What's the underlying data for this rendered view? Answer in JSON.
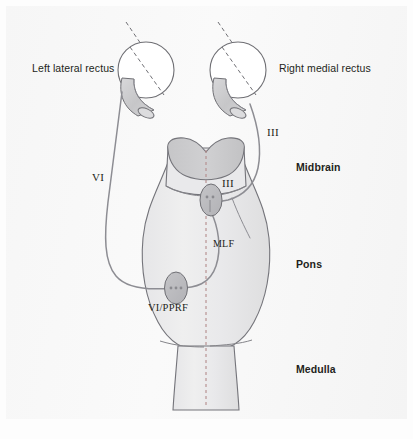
{
  "figure": {
    "name": "brainstem-horizontal-gaze-pathway",
    "background_color": "#f7f7f7",
    "page_color": "#fdfdfd"
  },
  "palette": {
    "outline": "#6f6f74",
    "brainstem_fill_light": "#ececed",
    "brainstem_fill_mid": "#e3e3e5",
    "peduncle_fill": "#c9c9cb",
    "nucleus_fill": "#bdbdc0",
    "muscle_fill": "#cfcfd1",
    "nerve_stroke": "#8d8d93",
    "midline_dash": "#b08a8a",
    "eye_fill": "#ffffff",
    "text": "#231f20"
  },
  "labels": {
    "left_muscle": "Left lateral rectus",
    "right_muscle": "Right medial rectus",
    "nerve_six": "VI",
    "nerve_three_fascicle": "III",
    "nucleus_three": "III",
    "tract_mlf": "MLF",
    "nucleus_six_pprf": "VI/PPRF",
    "region_midbrain": "Midbrain",
    "region_pons": "Pons",
    "region_medulla": "Medulla"
  },
  "structures": {
    "left_eye": "left-eye-globe",
    "right_eye": "right-eye-globe",
    "left_lateral_rectus": "left-lateral-rectus-muscle",
    "right_medial_rectus": "right-medial-rectus-muscle",
    "brainstem": "brainstem-outline",
    "cerebral_peduncles": "cerebral-peduncles",
    "midline": "midline-dashed-axis",
    "abducens_nerve": "abducens-nerve-VI",
    "oculomotor_nerve": "oculomotor-nerve-III",
    "mlf_tract": "medial-longitudinal-fasciculus",
    "oculomotor_nucleus": "oculomotor-nucleus",
    "abducens_pprf_nucleus": "abducens-pprf-nucleus",
    "pons_medulla_junction": "pons-medulla-junction-line",
    "midbrain_pons_junction": "midbrain-pons-junction-line"
  }
}
